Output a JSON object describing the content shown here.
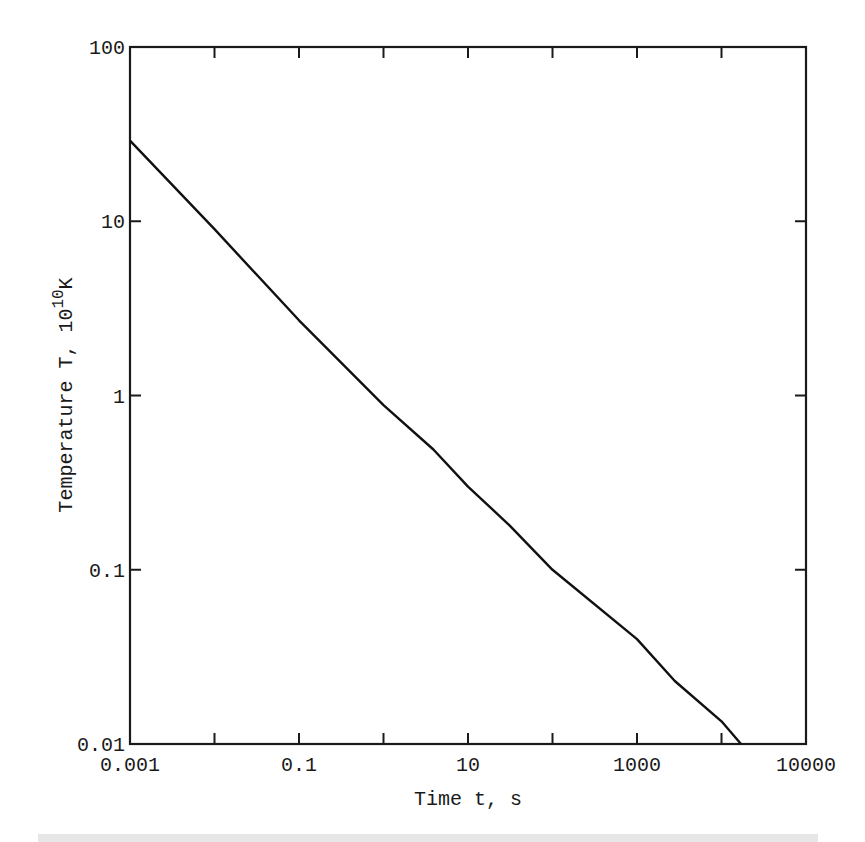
{
  "chart_data": {
    "type": "line",
    "title": "",
    "xlabel": "Time t, s",
    "ylabel": "Temperature T, 10^10 K",
    "ylabel_parts": {
      "main": "Temperature T, 10",
      "sup": "10",
      "unit": "K"
    },
    "xscale": "log",
    "yscale": "log",
    "xlim": [
      0.001,
      100000
    ],
    "ylim": [
      0.01,
      100
    ],
    "x_ticks": [
      0.001,
      0.01,
      0.1,
      1,
      10,
      100,
      1000,
      10000,
      100000
    ],
    "x_tick_labels": [
      {
        "value": 0.001,
        "label": "0.001"
      },
      {
        "value": 0.1,
        "label": "0.1"
      },
      {
        "value": 10,
        "label": "10"
      },
      {
        "value": 1000,
        "label": "1000"
      },
      {
        "value": 100000,
        "label": "10000"
      }
    ],
    "y_ticks": [
      0.01,
      0.1,
      1,
      10,
      100
    ],
    "y_tick_labels": [
      {
        "value": 100,
        "label": "100"
      },
      {
        "value": 10,
        "label": "10"
      },
      {
        "value": 1,
        "label": "1"
      },
      {
        "value": 0.1,
        "label": "0.1"
      },
      {
        "value": 0.01,
        "label": "0.01"
      }
    ],
    "grid": false,
    "legend": null,
    "series": [
      {
        "name": "T(t)",
        "color": "#111111",
        "x": [
          0.001,
          0.01,
          0.1,
          1,
          3.9,
          10,
          31,
          100,
          1000,
          2800,
          10000,
          17000
        ],
        "y": [
          29,
          9.0,
          2.7,
          0.88,
          0.49,
          0.3,
          0.18,
          0.1,
          0.04,
          0.023,
          0.0135,
          0.01
        ]
      }
    ]
  }
}
